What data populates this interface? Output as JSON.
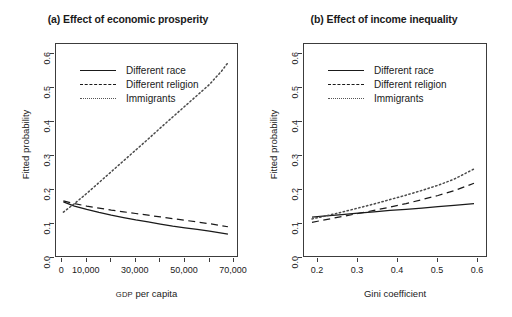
{
  "figure": {
    "background": "#ffffff",
    "line_color": "#1a1a1a",
    "frame_color": "#3c3c3c"
  },
  "chart_data": [
    {
      "type": "line",
      "panel": "a",
      "title": "(a) Effect of economic prosperity",
      "xlabel": "GDP per capita",
      "xlabel_smallcaps_prefix": "GDP",
      "xlabel_rest": " per capita",
      "ylabel": "Fitted probability",
      "xlim": [
        -2500,
        72000
      ],
      "ylim": [
        0.0,
        0.63
      ],
      "grid": false,
      "legend_position": "top-left-inside",
      "xticks": [
        0,
        10000,
        20000,
        30000,
        40000,
        50000,
        60000,
        70000
      ],
      "xticklabels": [
        "0",
        "10,000",
        "",
        "30,000",
        "",
        "50,000",
        "",
        "70,000"
      ],
      "yticks": [
        0.0,
        0.1,
        0.2,
        0.3,
        0.4,
        0.5,
        0.6
      ],
      "yticklabels": [
        "0.0",
        "0.1",
        "0.2",
        "0.3",
        "0.4",
        "0.5",
        "0.6"
      ],
      "x": [
        500,
        5000,
        10000,
        15000,
        20000,
        25000,
        30000,
        35000,
        40000,
        45000,
        50000,
        55000,
        60000,
        65000,
        67500
      ],
      "series": [
        {
          "name": "Different race",
          "style": "solid",
          "values": [
            0.165,
            0.153,
            0.143,
            0.134,
            0.126,
            0.119,
            0.112,
            0.106,
            0.1,
            0.094,
            0.089,
            0.084,
            0.079,
            0.073,
            0.07
          ]
        },
        {
          "name": "Different religion",
          "style": "dashed",
          "values": [
            0.168,
            0.16,
            0.153,
            0.147,
            0.141,
            0.136,
            0.131,
            0.126,
            0.121,
            0.116,
            0.111,
            0.106,
            0.101,
            0.095,
            0.092
          ]
        },
        {
          "name": "Immigrants",
          "style": "dotted",
          "values": [
            0.135,
            0.16,
            0.19,
            0.222,
            0.254,
            0.286,
            0.318,
            0.35,
            0.383,
            0.415,
            0.447,
            0.479,
            0.511,
            0.551,
            0.575
          ]
        }
      ]
    },
    {
      "type": "line",
      "panel": "b",
      "title": "(b) Effect of income inequality",
      "xlabel": "Gini coefficient",
      "ylabel": "Fitted probability",
      "xlim": [
        0.165,
        0.625
      ],
      "ylim": [
        0.0,
        0.63
      ],
      "grid": false,
      "legend_position": "top-left-inside",
      "xticks": [
        0.2,
        0.3,
        0.4,
        0.5,
        0.6
      ],
      "xticklabels": [
        "0.2",
        "0.3",
        "0.4",
        "0.5",
        "0.6"
      ],
      "yticks": [
        0.0,
        0.1,
        0.2,
        0.3,
        0.4,
        0.5,
        0.6
      ],
      "yticklabels": [
        "0.0",
        "0.1",
        "0.2",
        "0.3",
        "0.4",
        "0.5",
        "0.6"
      ],
      "x": [
        0.185,
        0.22,
        0.26,
        0.3,
        0.34,
        0.38,
        0.42,
        0.46,
        0.5,
        0.54,
        0.59
      ],
      "series": [
        {
          "name": "Different race",
          "style": "solid",
          "values": [
            0.12,
            0.124,
            0.128,
            0.132,
            0.136,
            0.14,
            0.143,
            0.147,
            0.151,
            0.155,
            0.16
          ]
        },
        {
          "name": "Different religion",
          "style": "dashed",
          "values": [
            0.105,
            0.113,
            0.122,
            0.131,
            0.14,
            0.15,
            0.16,
            0.172,
            0.184,
            0.198,
            0.22
          ]
        },
        {
          "name": "Immigrants",
          "style": "dotted",
          "values": [
            0.115,
            0.124,
            0.135,
            0.147,
            0.159,
            0.172,
            0.185,
            0.199,
            0.214,
            0.232,
            0.262
          ]
        }
      ]
    }
  ],
  "legend": {
    "entries": [
      {
        "label": "Different race",
        "style": "solid"
      },
      {
        "label": "Different religion",
        "style": "dashed"
      },
      {
        "label": "Immigrants",
        "style": "dotted"
      }
    ]
  }
}
